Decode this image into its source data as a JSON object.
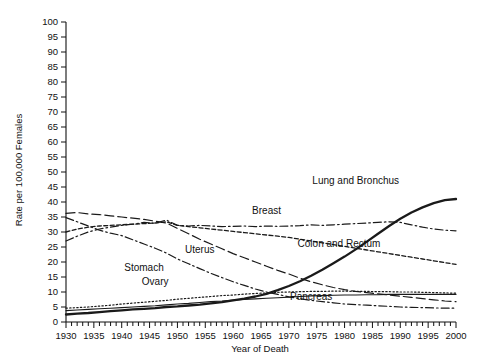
{
  "chart_data": {
    "type": "line",
    "title": "",
    "xlabel": "Year of Death",
    "ylabel": "Rate per 100,000 Females",
    "xlim": [
      1930,
      2000
    ],
    "ylim": [
      0,
      100
    ],
    "ytick_step": 5,
    "xtick_step": 5,
    "minor_xtick_step": 1,
    "grid": false,
    "legend": "inline-annotations",
    "ytick_labels": [
      "0",
      "5",
      "10",
      "15",
      "20",
      "25",
      "30",
      "35",
      "40",
      "45",
      "50",
      "55",
      "60",
      "65",
      "70",
      "75",
      "80",
      "85",
      "90",
      "95",
      "100"
    ],
    "xtick_labels": [
      "1930",
      "1935",
      "1940",
      "1945",
      "1950",
      "1955",
      "1960",
      "1965",
      "1970",
      "1975",
      "1980",
      "1985",
      "1990",
      "1995",
      "2000"
    ],
    "x": [
      1930,
      1932,
      1934,
      1936,
      1938,
      1940,
      1942,
      1944,
      1946,
      1948,
      1950,
      1952,
      1954,
      1956,
      1958,
      1960,
      1962,
      1964,
      1966,
      1968,
      1970,
      1972,
      1974,
      1976,
      1978,
      1980,
      1982,
      1984,
      1986,
      1988,
      1990,
      1992,
      1994,
      1996,
      1998,
      2000
    ],
    "series": [
      {
        "name": "Lung and Bronchus",
        "style": "solid",
        "label_x": 1982,
        "label_y": 46,
        "values": [
          2.5,
          2.8,
          3.0,
          3.3,
          3.6,
          3.9,
          4.2,
          4.4,
          4.6,
          5.0,
          5.2,
          5.5,
          5.8,
          6.2,
          6.6,
          7.2,
          7.8,
          8.5,
          9.4,
          10.6,
          12.0,
          13.6,
          15.4,
          17.4,
          19.6,
          21.8,
          24.2,
          26.8,
          29.4,
          32.0,
          34.4,
          36.5,
          38.2,
          39.6,
          40.6,
          41.0
        ]
      },
      {
        "name": "Breast",
        "style": "dashdot",
        "label_x": 1966,
        "label_y": 36,
        "values": [
          27.0,
          28.6,
          30.0,
          31.0,
          31.6,
          32.2,
          32.6,
          33.2,
          32.9,
          34.0,
          32.2,
          32.0,
          32.2,
          32.0,
          31.8,
          31.9,
          32.0,
          31.8,
          32.0,
          31.9,
          32.0,
          32.1,
          32.4,
          32.2,
          32.4,
          32.6,
          32.8,
          33.0,
          33.2,
          33.4,
          33.2,
          32.4,
          31.6,
          31.0,
          30.6,
          30.4
        ]
      },
      {
        "name": "Colon and Rectum",
        "style": "dotted-dash",
        "label_x": 1979,
        "label_y": 25,
        "values": [
          30.0,
          31.0,
          31.6,
          32.0,
          32.2,
          32.4,
          32.6,
          32.8,
          33.0,
          33.4,
          32.2,
          31.8,
          31.4,
          31.0,
          30.6,
          30.2,
          29.8,
          29.4,
          29.0,
          28.6,
          28.2,
          27.6,
          27.0,
          26.4,
          25.8,
          25.2,
          24.6,
          24.0,
          23.4,
          22.8,
          22.2,
          21.6,
          21.0,
          20.4,
          19.8,
          19.2
        ]
      },
      {
        "name": "Uterus",
        "style": "longdash",
        "label_x": 1954,
        "label_y": 23,
        "values": [
          36.2,
          36.5,
          36.0,
          35.8,
          35.4,
          35.0,
          34.6,
          34.2,
          33.6,
          33.0,
          31.2,
          29.4,
          27.6,
          26.0,
          24.4,
          22.8,
          21.4,
          20.0,
          18.6,
          17.2,
          16.0,
          14.6,
          13.4,
          12.4,
          11.5,
          10.8,
          10.2,
          9.8,
          9.4,
          9.0,
          8.6,
          8.2,
          7.8,
          7.4,
          7.0,
          6.8
        ]
      },
      {
        "name": "Stomach",
        "style": "dashdot",
        "label_x": 1944,
        "label_y": 17,
        "values": [
          34.8,
          33.4,
          32.0,
          30.6,
          29.6,
          28.8,
          27.4,
          26.0,
          24.6,
          23.0,
          21.0,
          19.4,
          17.8,
          16.2,
          14.8,
          13.4,
          12.2,
          11.0,
          10.0,
          9.2,
          8.4,
          7.8,
          7.2,
          6.8,
          6.4,
          6.0,
          5.8,
          5.6,
          5.4,
          5.2,
          5.0,
          4.9,
          4.8,
          4.7,
          4.6,
          4.6
        ]
      },
      {
        "name": "Ovary",
        "style": "dotted",
        "label_x": 1946,
        "label_y": 12.5,
        "values": [
          4.6,
          4.8,
          5.0,
          5.3,
          5.6,
          6.0,
          6.3,
          6.6,
          6.9,
          7.2,
          7.6,
          7.9,
          8.2,
          8.5,
          8.8,
          9.0,
          9.3,
          9.5,
          9.7,
          9.9,
          10.0,
          10.1,
          10.2,
          10.2,
          10.3,
          10.3,
          10.2,
          10.2,
          10.1,
          10.1,
          10.0,
          10.0,
          9.9,
          9.8,
          9.7,
          9.6
        ]
      },
      {
        "name": "Pancreas",
        "style": "solid-thin",
        "label_x": 1974,
        "label_y": 7.5,
        "values": [
          3.8,
          4.0,
          4.2,
          4.4,
          4.6,
          4.8,
          5.0,
          5.2,
          5.4,
          5.7,
          6.0,
          6.2,
          6.5,
          6.8,
          7.0,
          7.3,
          7.5,
          7.7,
          7.9,
          8.1,
          8.3,
          8.5,
          8.7,
          8.8,
          8.9,
          9.0,
          9.0,
          9.1,
          9.1,
          9.2,
          9.2,
          9.2,
          9.2,
          9.2,
          9.2,
          9.2
        ]
      }
    ]
  }
}
